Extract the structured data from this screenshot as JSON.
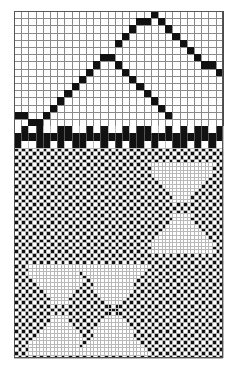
{
  "document": {
    "title": "Pattern Chart",
    "kind": "knitting-colourwork-chart",
    "background_color": "#ffffff",
    "mark_color": "#111111",
    "grid_line_color": "#8a8a8a",
    "fine_grid_line_color": "#b9b9b9"
  },
  "chart_data": {
    "type": "heatmap",
    "subtitle": "",
    "xlabel": "",
    "ylabel": "",
    "legend": [],
    "grid": true,
    "sections": [
      {
        "name": "upper-zigzag",
        "columns": 29,
        "rows": 16,
        "cell_width": 7.2,
        "cell_height": 7.2,
        "origin_x": 14,
        "origin_y": 11,
        "description": "Two chevron peaks drawn as single-stitch diagonal lines on an open grid",
        "filled_cells": [
          [
            0,
            14
          ],
          [
            1,
            14
          ],
          [
            2,
            15
          ],
          [
            3,
            15
          ],
          [
            4,
            14
          ],
          [
            5,
            13
          ],
          [
            6,
            12
          ],
          [
            7,
            11
          ],
          [
            8,
            10
          ],
          [
            9,
            9
          ],
          [
            10,
            8
          ],
          [
            11,
            7
          ],
          [
            12,
            6
          ],
          [
            13,
            6
          ],
          [
            14,
            7
          ],
          [
            15,
            8
          ],
          [
            16,
            9
          ],
          [
            17,
            10
          ],
          [
            18,
            11
          ],
          [
            19,
            12
          ],
          [
            20,
            13
          ],
          [
            21,
            14
          ],
          [
            15,
            3
          ],
          [
            16,
            2
          ],
          [
            17,
            1
          ],
          [
            18,
            1
          ],
          [
            19,
            0
          ],
          [
            20,
            1
          ],
          [
            21,
            2
          ],
          [
            22,
            3
          ],
          [
            23,
            4
          ],
          [
            24,
            5
          ],
          [
            25,
            6
          ],
          [
            26,
            7
          ],
          [
            27,
            7
          ],
          [
            28,
            8
          ],
          [
            14,
            4
          ]
        ]
      },
      {
        "name": "divider-bar",
        "columns": 29,
        "rows": 3,
        "cell_width": 7.2,
        "cell_height": 7.2,
        "origin_x": 14,
        "origin_y": 126.2,
        "description": "Solid black stripe with alternating dashes above and below",
        "rows_data": [
          [
            0,
            1,
            0,
            1,
            0,
            0,
            1,
            1,
            0,
            0,
            1,
            0,
            1,
            0,
            0,
            1,
            0,
            1,
            1,
            0,
            0,
            1,
            0,
            1,
            0,
            1,
            1,
            0,
            1
          ],
          [
            1,
            1,
            1,
            1,
            1,
            1,
            1,
            1,
            1,
            1,
            1,
            1,
            1,
            1,
            1,
            1,
            1,
            1,
            1,
            1,
            1,
            1,
            1,
            1,
            1,
            1,
            1,
            1,
            1
          ],
          [
            1,
            0,
            0,
            1,
            1,
            0,
            1,
            0,
            1,
            1,
            0,
            0,
            1,
            0,
            1,
            0,
            1,
            1,
            0,
            1,
            0,
            0,
            1,
            1,
            0,
            1,
            0,
            1,
            0
          ]
        ]
      },
      {
        "name": "lower-checkerboard",
        "columns": 58,
        "rows": 58,
        "cell_width": 3.6,
        "cell_height": 3.63,
        "origin_x": 14,
        "origin_y": 147.8,
        "description": "Dense one-by-one checkerboard interrupted by three open bowtie/hourglass motifs",
        "motifs": [
          {
            "name": "bowtie-upper-right",
            "center_col": 46,
            "center_row": 16,
            "half_width": 9,
            "half_height": 12
          },
          {
            "name": "bowtie-lower-left-a",
            "center_col": 12,
            "center_row": 44,
            "half_width": 9,
            "half_height": 12
          },
          {
            "name": "bowtie-lower-left-b",
            "center_col": 27,
            "center_row": 44,
            "half_width": 9,
            "half_height": 12
          }
        ]
      }
    ]
  }
}
